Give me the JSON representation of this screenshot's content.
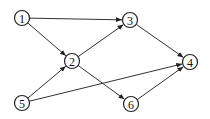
{
  "graph": {
    "type": "directed",
    "nodes": [
      {
        "id": "1",
        "label": "1",
        "x": 22,
        "y": 18
      },
      {
        "id": "2",
        "label": "2",
        "x": 72,
        "y": 61
      },
      {
        "id": "3",
        "label": "3",
        "x": 130,
        "y": 20
      },
      {
        "id": "4",
        "label": "4",
        "x": 190,
        "y": 62
      },
      {
        "id": "5",
        "label": "5",
        "x": 22,
        "y": 103
      },
      {
        "id": "6",
        "label": "6",
        "x": 131,
        "y": 104
      }
    ],
    "edges": [
      {
        "from": "1",
        "to": "3"
      },
      {
        "from": "1",
        "to": "2"
      },
      {
        "from": "2",
        "to": "3"
      },
      {
        "from": "3",
        "to": "4"
      },
      {
        "from": "2",
        "to": "6"
      },
      {
        "from": "5",
        "to": "2"
      },
      {
        "from": "5",
        "to": "4"
      },
      {
        "from": "6",
        "to": "4"
      }
    ]
  }
}
